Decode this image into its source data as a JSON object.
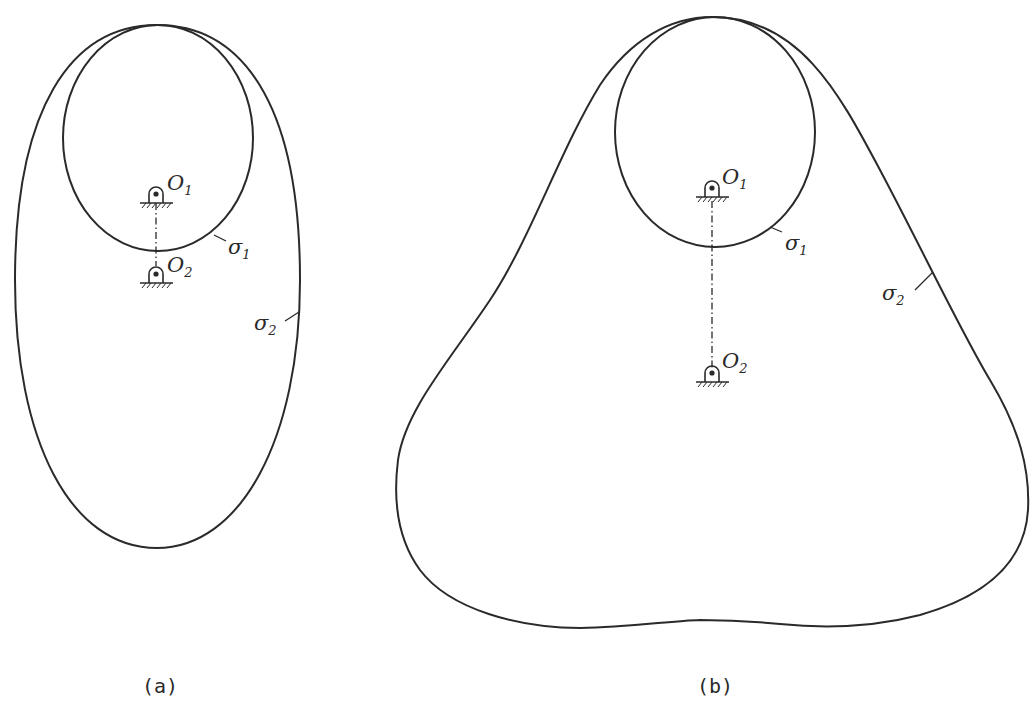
{
  "figures": [
    {
      "id": "a",
      "caption": "(a)",
      "labels": {
        "pivot1": {
          "main": "O",
          "sub": "1"
        },
        "pivot2": {
          "main": "O",
          "sub": "2"
        },
        "curve1": {
          "main": "σ",
          "sub": "1"
        },
        "curve2": {
          "main": "σ",
          "sub": "2"
        }
      }
    },
    {
      "id": "b",
      "caption": "(b)",
      "labels": {
        "pivot1": {
          "main": "O",
          "sub": "1"
        },
        "pivot2": {
          "main": "O",
          "sub": "2"
        },
        "curve1": {
          "main": "σ",
          "sub": "1"
        },
        "curve2": {
          "main": "σ",
          "sub": "2"
        }
      }
    }
  ],
  "colors": {
    "stroke": "#2a2a2a",
    "background": "#ffffff"
  }
}
